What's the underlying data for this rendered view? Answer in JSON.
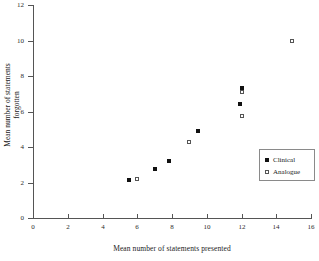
{
  "chart_data": {
    "type": "scatter",
    "title": "",
    "xlabel": "Mean number of statements presented",
    "ylabel": "Mean number of statements forgotten",
    "ylabel_line1": "Mean number of statements",
    "ylabel_line2": "forgotten",
    "xlim": [
      0,
      16
    ],
    "ylim": [
      0,
      12
    ],
    "xticks": [
      0,
      2,
      4,
      6,
      8,
      10,
      12,
      14,
      16
    ],
    "yticks": [
      0,
      2,
      4,
      6,
      8,
      10,
      12
    ],
    "xticklabels": [
      "0",
      "2",
      "4",
      "6",
      "8",
      "10",
      "12",
      "14",
      "16"
    ],
    "yticklabels": [
      "0",
      "2",
      "4",
      "6",
      "8",
      "10",
      "12"
    ],
    "grid": false,
    "legend_position": "right-middle",
    "series": [
      {
        "name": "Clinical",
        "marker": "filled-square",
        "color": "#111111",
        "points": [
          {
            "x": 5.5,
            "y": 2.15
          },
          {
            "x": 7.0,
            "y": 2.75
          },
          {
            "x": 7.8,
            "y": 3.2
          },
          {
            "x": 9.5,
            "y": 4.9
          },
          {
            "x": 11.9,
            "y": 6.4
          },
          {
            "x": 12.0,
            "y": 7.3
          }
        ]
      },
      {
        "name": "Analogue",
        "marker": "open-square",
        "color": "#555555",
        "points": [
          {
            "x": 6.0,
            "y": 2.2
          },
          {
            "x": 9.0,
            "y": 4.3
          },
          {
            "x": 12.0,
            "y": 5.75
          },
          {
            "x": 12.0,
            "y": 7.1
          },
          {
            "x": 14.9,
            "y": 10.0
          }
        ]
      }
    ]
  },
  "legend": {
    "entries": [
      {
        "label": "Clinical"
      },
      {
        "label": "Analogue"
      }
    ]
  }
}
